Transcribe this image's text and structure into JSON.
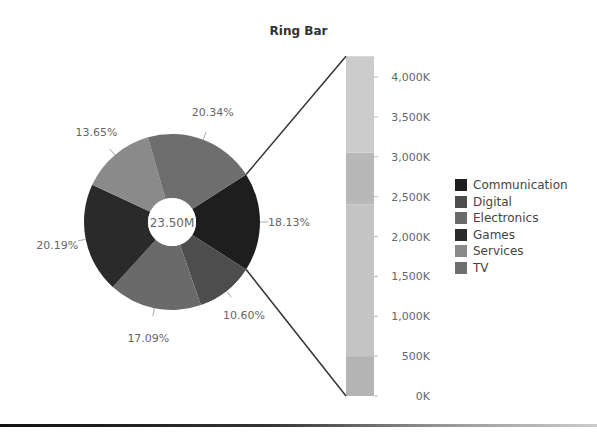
{
  "chart_data": {
    "type": "pie",
    "title": "Ring Bar",
    "center_label": "23.50M",
    "total": 23500000,
    "slices": [
      {
        "name": "Communication",
        "percent": 18.13,
        "color": "#1e1e1e"
      },
      {
        "name": "Digital",
        "percent": 10.6,
        "color": "#4d4d4d"
      },
      {
        "name": "Electronics",
        "percent": 17.09,
        "color": "#6a6a6a"
      },
      {
        "name": "Games",
        "percent": 20.19,
        "color": "#2a2a2a"
      },
      {
        "name": "Services",
        "percent": 13.65,
        "color": "#8a8a8a"
      },
      {
        "name": "TV",
        "percent": 20.34,
        "color": "#6e6e6e"
      }
    ],
    "labels": [
      "18.13%",
      "10.60%",
      "17.09%",
      "20.19%",
      "13.65%",
      "20.34%"
    ],
    "bar": {
      "type": "stacked-bar",
      "drilldown_of": "Communication",
      "total_k": 4260,
      "yaxis_ticks": [
        "0K",
        "500K",
        "1,000K",
        "1,500K",
        "2,000K",
        "2,500K",
        "3,000K",
        "3,500K",
        "4,000K"
      ],
      "ylim": [
        0,
        4000
      ],
      "segments": [
        {
          "from_k": 0,
          "to_k": 500,
          "color": "#b4b4b4"
        },
        {
          "from_k": 500,
          "to_k": 2400,
          "color": "#c4c4c4"
        },
        {
          "from_k": 2400,
          "to_k": 3050,
          "color": "#b8b8b8"
        },
        {
          "from_k": 3050,
          "to_k": 4260,
          "color": "#cccccc"
        }
      ]
    },
    "legend": [
      "Communication",
      "Digital",
      "Electronics",
      "Games",
      "Services",
      "TV"
    ],
    "legend_position": "right"
  }
}
